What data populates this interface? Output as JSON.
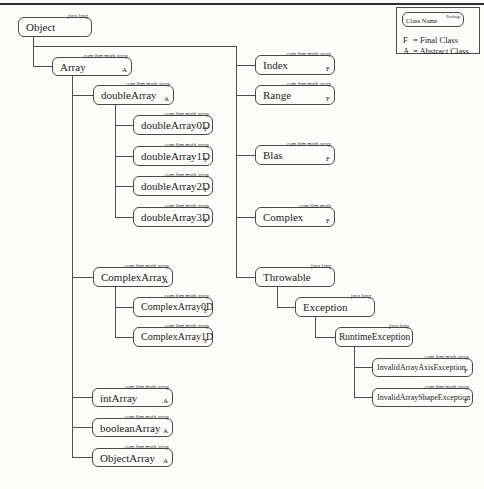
{
  "legend": {
    "class_name_label": "Class Name",
    "package_label": "Package",
    "final_letter": "F",
    "final_text": "= Final Class",
    "abstract_letter": "A",
    "abstract_text": "= Abstract Class"
  },
  "nodes": {
    "object": {
      "name": "Object",
      "package": "java.lang",
      "modifier": ""
    },
    "array": {
      "name": "Array",
      "package": "com.ibm.math.array",
      "modifier": "A"
    },
    "doubleArray": {
      "name": "doubleArray",
      "package": "com.ibm.math.array",
      "modifier": "A"
    },
    "doubleArray0D": {
      "name": "doubleArray0D",
      "package": "com.ibm.math.array",
      "modifier": "F"
    },
    "doubleArray1D": {
      "name": "doubleArray1D",
      "package": "com.ibm.math.array",
      "modifier": "F"
    },
    "doubleArray2D": {
      "name": "doubleArray2D",
      "package": "com.ibm.math.array",
      "modifier": "F"
    },
    "doubleArray3D": {
      "name": "doubleArray3D",
      "package": "com.ibm.math.array",
      "modifier": "F"
    },
    "complexArray": {
      "name": "ComplexArray",
      "package": "com.ibm.math.array",
      "modifier": "A"
    },
    "complexArray0D": {
      "name": "ComplexArray0D",
      "package": "com.ibm.math.array",
      "modifier": "F"
    },
    "complexArray1D": {
      "name": "ComplexArray1D",
      "package": "com.ibm.math.array",
      "modifier": "F"
    },
    "intArray": {
      "name": "intArray",
      "package": "com.ibm.math.array",
      "modifier": "A"
    },
    "booleanArray": {
      "name": "booleanArray",
      "package": "com.ibm.math.array",
      "modifier": "A"
    },
    "objectArray": {
      "name": "ObjectArray",
      "package": "com.ibm.math.array",
      "modifier": "A"
    },
    "index": {
      "name": "Index",
      "package": "com.ibm.math.array",
      "modifier": "F"
    },
    "range": {
      "name": "Range",
      "package": "com.ibm.math.array",
      "modifier": "F"
    },
    "blas": {
      "name": "Blas",
      "package": "com.ibm.math.array",
      "modifier": "F"
    },
    "complex": {
      "name": "Complex",
      "package": "com.ibm.math",
      "modifier": "F"
    },
    "throwable": {
      "name": "Throwable",
      "package": "java.lang",
      "modifier": ""
    },
    "exception": {
      "name": "Exception",
      "package": "java.lang",
      "modifier": ""
    },
    "runtimeException": {
      "name": "RuntimeException",
      "package": "java.lang",
      "modifier": ""
    },
    "invalidArrayAxisException": {
      "name": "InvalidArrayAxisException",
      "package": "com.ibm.math.array",
      "modifier": "F"
    },
    "invalidArrayShapeException": {
      "name": "InvalidArrayShapeException",
      "package": "com.ibm.math.array",
      "modifier": "F"
    }
  },
  "colors": {
    "line": "#4f4f4f",
    "text": "#242424",
    "background": "#fcfcfa"
  }
}
